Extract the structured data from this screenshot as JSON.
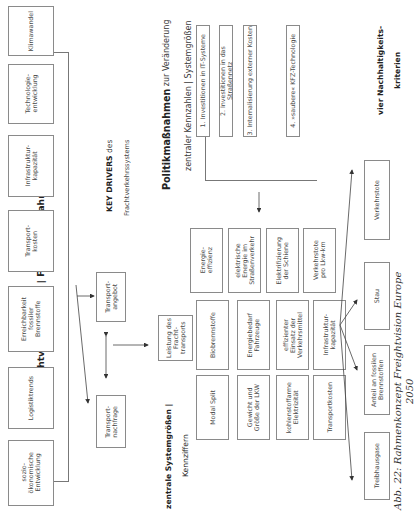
{
  "title": {
    "main": "Freightvision Europe | FVE 2050 | Rahmenkonzept"
  },
  "key_drivers": {
    "bold": "KEY DRIVERS",
    "rest": " des",
    "line2": "Frachtverkehrssystems",
    "items": [
      "sozio-\nökonomische\nEntwicklung",
      "Logistiktrends",
      "Erreichbarkeit\nfossiler\nBrennstoffe",
      "Transport-\nkosten",
      "Infrastruktur-\nkapazität",
      "Technologie-\nentwicklung",
      "Klimawandel"
    ]
  },
  "middle": {
    "transportnachfrage": "Transport-\nnachfrage",
    "transportangebot": "Transport-\nangebot",
    "leistung": "Leistung des\nFracht-\ntransports"
  },
  "policy": {
    "bold": "Politikmaßnahmen",
    "rest": " zur Veränderung",
    "line2": "zentraler Kennzahlen | Systemgrößen",
    "items": [
      "1. Investitionen in IT-Systeme",
      "2. Investitionen in das Straßennetz",
      "3. Internalisierung externer Kosten",
      "4. »saubere« KFZ-Technologie"
    ]
  },
  "system_sizes": {
    "heading_line1": "zentrale Systemgrößen |",
    "heading_line2": "Kennziffern",
    "grid": [
      [
        "Modal Split",
        "Biobrennstoffe",
        "Energie-\neffizienz"
      ],
      [
        "Gewicht und\nGröße der LKW",
        "Energiebedarf\nFahrzeuge",
        "elektrische\nEnergie im\nStraßenverkehr"
      ],
      [
        "kohlenstoffarme\nElektrizität",
        "effizienter\nEinsatz der\nVerkehrsmittel",
        "Elektrifizierung\nder Schiene"
      ],
      [
        "Transportkosten",
        "Infrastruktur-\nkapazität",
        "Verkehrstote\npro Lkw-km"
      ]
    ]
  },
  "sustainability": {
    "heading_line1": "vier Nachhaltigkeits-",
    "heading_line2": "kriterien",
    "items": [
      "Treibhausgase",
      "Anteil an fossilen\nBrennstoffen",
      "Stau",
      "Verkehrstote"
    ]
  },
  "caption": "Abb. 22: Rahmenkonzept Freightvision Europe 2050"
}
